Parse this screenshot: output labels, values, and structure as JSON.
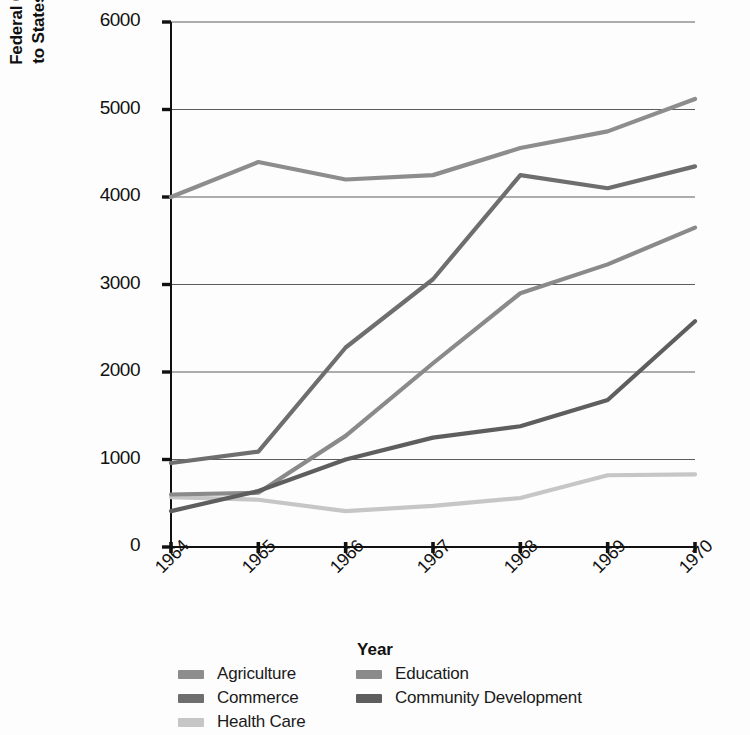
{
  "chart_data": {
    "type": "line",
    "title": "",
    "xlabel": "Year",
    "ylabel": "Federal Grants-in-Aid\nto States (in millions)",
    "categories": [
      "1964",
      "1965",
      "1966",
      "1967",
      "1968",
      "1969",
      "1970"
    ],
    "x": [
      1964,
      1965,
      1966,
      1967,
      1968,
      1969,
      1970
    ],
    "ylim": [
      0,
      6000
    ],
    "yticks": [
      0,
      1000,
      2000,
      3000,
      4000,
      5000,
      6000
    ],
    "ytick_labels": [
      "0",
      "1000",
      "2000",
      "3000",
      "4000",
      "5000",
      "6000"
    ],
    "grid": true,
    "legend_position": "bottom",
    "series": [
      {
        "name": "Agriculture",
        "color": "#8d8d8d",
        "values": [
          4000,
          4400,
          4200,
          4250,
          4560,
          4750,
          5120
        ]
      },
      {
        "name": "Commerce",
        "color": "#6e6e6e",
        "values": [
          960,
          1090,
          2280,
          3060,
          4250,
          4100,
          4350
        ]
      },
      {
        "name": "Health Care",
        "color": "#c6c6c6",
        "values": [
          570,
          540,
          410,
          470,
          560,
          820,
          830
        ]
      },
      {
        "name": "Education",
        "color": "#8a8a8a",
        "values": [
          600,
          620,
          1270,
          2100,
          2900,
          3230,
          3650
        ]
      },
      {
        "name": "Community Development",
        "color": "#5e5e5e",
        "values": [
          410,
          640,
          1000,
          1250,
          1380,
          1680,
          2580
        ]
      }
    ]
  },
  "legend": {
    "columns": [
      {
        "items": [
          "Agriculture",
          "Commerce",
          "Health Care"
        ]
      },
      {
        "items": [
          "Education",
          "Community Development"
        ]
      }
    ]
  },
  "axis": {
    "x_title": "Year",
    "y_title_line1": "Federal Grants-in-Aid",
    "y_title_line2": "to States (in millions)"
  }
}
